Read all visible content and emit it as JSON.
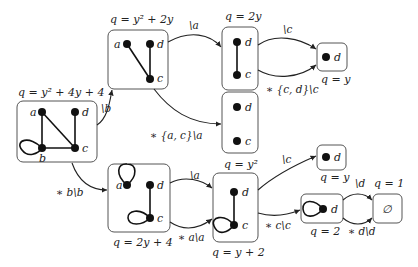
{
  "diagram": {
    "type": "state-transition-graph-reduction",
    "boxes": [
      {
        "id": "A",
        "label": "q = y² + 4y + 4",
        "vertices": [
          "a",
          "b",
          "c",
          "d"
        ],
        "edges": [
          "a-b",
          "a-c",
          "d-c",
          "b-c",
          "b-b(loop)"
        ]
      },
      {
        "id": "B",
        "label": "q = y² + 2y",
        "vertices": [
          "a",
          "d",
          "c"
        ],
        "edges": [
          "a-c",
          "d-c"
        ]
      },
      {
        "id": "C",
        "label": "q = 2y",
        "vertices": [
          "d",
          "c"
        ],
        "edges": [
          "d-c"
        ]
      },
      {
        "id": "D",
        "label": "q = y",
        "vertices": [
          "d"
        ],
        "edges": []
      },
      {
        "id": "E",
        "label": "q = y²",
        "vertices": [
          "d",
          "c"
        ],
        "edges": []
      },
      {
        "id": "F",
        "label": "q = 2y + 4",
        "vertices": [
          "a",
          "d",
          "c"
        ],
        "edges": [
          "a-a(loop)",
          "d-c",
          "c-c(loop)"
        ]
      },
      {
        "id": "G",
        "label": "q = y + 2",
        "vertices": [
          "d",
          "c"
        ],
        "edges": [
          "d-c",
          "c-c(loop)"
        ]
      },
      {
        "id": "H",
        "label": "q = y",
        "vertices": [
          "d"
        ],
        "edges": []
      },
      {
        "id": "I",
        "label": "q = 2",
        "vertices": [
          "d"
        ],
        "edges": [
          "d-d(loop)"
        ]
      },
      {
        "id": "J",
        "label": "q = 1",
        "vertices": [],
        "content": "∅"
      }
    ],
    "transitions": [
      {
        "from": "A",
        "to": "B",
        "label": "\\b"
      },
      {
        "from": "A",
        "to": "F",
        "label": "∗ b\\b"
      },
      {
        "from": "B",
        "to": "C",
        "label": "\\a"
      },
      {
        "from": "B",
        "to": "E",
        "label": "∗ {a, c}\\a"
      },
      {
        "from": "C",
        "to": "D",
        "label": "\\c"
      },
      {
        "from": "C",
        "to": "D",
        "label": "∗ {c, d}\\c"
      },
      {
        "from": "F",
        "to": "G",
        "label": "\\a"
      },
      {
        "from": "F",
        "to": "G",
        "label": "∗ a\\a"
      },
      {
        "from": "G",
        "to": "H",
        "label": "\\c"
      },
      {
        "from": "G",
        "to": "I",
        "label": "∗ c\\c"
      },
      {
        "from": "I",
        "to": "J",
        "label": "\\d"
      },
      {
        "from": "I",
        "to": "J",
        "label": "∗ d\\d"
      }
    ]
  },
  "labels": {
    "A": "q = y² + 4y + 4",
    "B": "q = y² + 2y",
    "C": "q = 2y",
    "D": "q = y",
    "E": "q = y²",
    "F": "q = 2y + 4",
    "G": "q = y + 2",
    "H": "q = y",
    "I": "q = 2",
    "J": "q = 1",
    "J_content": "∅",
    "t_AB": "\\b",
    "t_AF": "∗ b\\b",
    "t_BC": "\\a",
    "t_BE": "∗ {a, c}\\a",
    "t_CD1": "\\c",
    "t_CD2": "∗ {c, d}\\c",
    "t_FG1": "\\a",
    "t_FG2": "∗ a\\a",
    "t_GH": "\\c",
    "t_GI": "∗ c\\c",
    "t_IJ1": "\\d",
    "t_IJ2": "∗ d\\d",
    "v_a": "a",
    "v_b": "b",
    "v_c": "c",
    "v_d": "d"
  }
}
